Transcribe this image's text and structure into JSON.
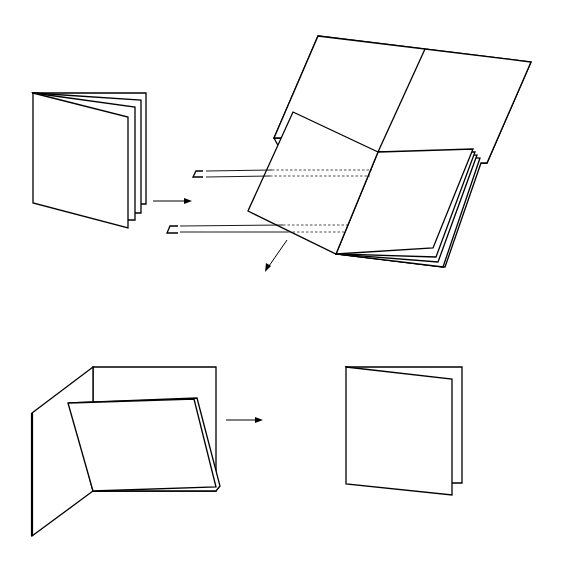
{
  "diagram": {
    "title": "",
    "colors": {
      "line": "#000000",
      "background": "#ffffff"
    },
    "steps": [
      {
        "id": "step-1",
        "label": "Folded sheets nested together"
      },
      {
        "id": "step-2",
        "label": "Opened booklet inserted into cover and stapled along fold"
      },
      {
        "id": "step-3",
        "label": "Cover folded around pages"
      },
      {
        "id": "step-4",
        "label": "Finished booklet"
      }
    ],
    "arrows": [
      {
        "id": "arrow-1",
        "from": "step-1",
        "to": "step-2"
      },
      {
        "id": "arrow-2",
        "from": "step-2",
        "to": "step-3"
      },
      {
        "id": "arrow-3",
        "from": "step-3",
        "to": "step-4"
      }
    ],
    "staples": 2
  }
}
